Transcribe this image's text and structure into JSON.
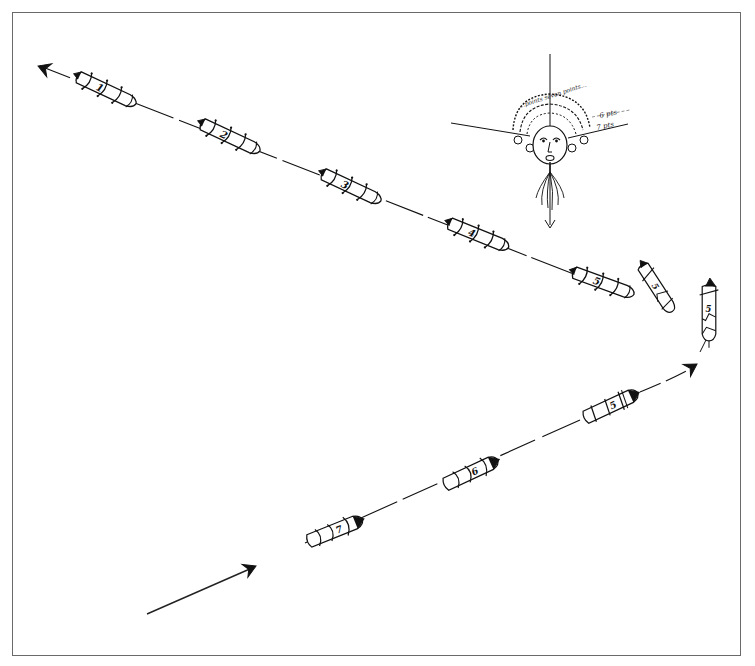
{
  "diagram": {
    "type": "hand-drawn sailing maneuver diagram",
    "frame": {
      "border_color": "#6a6a6a",
      "background": "#ffffff"
    },
    "ink_color": "#111111",
    "wind_head": {
      "label": "wind-god face (compass rose)",
      "arc_text": "...points seven points...",
      "labels": [
        "6 pts",
        "7 pts"
      ]
    },
    "ships": [
      {
        "id": "ship-1",
        "number": "1",
        "x": 106,
        "y": 90,
        "angle": 25
      },
      {
        "id": "ship-2",
        "number": "2",
        "x": 230,
        "y": 137,
        "angle": 25
      },
      {
        "id": "ship-3",
        "number": "3",
        "x": 351,
        "y": 187,
        "angle": 25
      },
      {
        "id": "ship-4",
        "number": "4",
        "x": 478,
        "y": 235,
        "angle": 22
      },
      {
        "id": "ship-5a",
        "number": "5",
        "x": 603,
        "y": 283,
        "angle": 20
      },
      {
        "id": "ship-5b",
        "number": "5",
        "x": 657,
        "y": 288,
        "angle": 57
      },
      {
        "id": "ship-5c",
        "number": "5",
        "x": 709,
        "y": 312,
        "angle": 85
      },
      {
        "id": "ship-5d",
        "number": "5",
        "x": 610,
        "y": 406,
        "angle": -25
      },
      {
        "id": "ship-6",
        "number": "6",
        "x": 470,
        "y": 473,
        "angle": -25
      },
      {
        "id": "ship-7",
        "number": "7",
        "x": 334,
        "y": 531,
        "angle": -22
      }
    ],
    "arrows": [
      {
        "id": "entry-arrow",
        "label": "start direction"
      },
      {
        "id": "exit-arrow",
        "label": "outgoing course"
      },
      {
        "id": "turn-arrow",
        "label": "turning course"
      }
    ]
  }
}
